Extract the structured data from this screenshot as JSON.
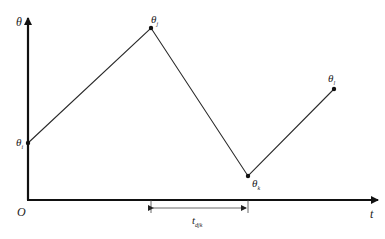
{
  "diagram": {
    "axes": {
      "y_label": "θ",
      "x_label": "t",
      "origin_label": "O"
    },
    "points": [
      {
        "id": "i",
        "base": "θ",
        "sub": "i",
        "x": 28,
        "y": 143
      },
      {
        "id": "j",
        "base": "θ",
        "sub": "j",
        "x": 151,
        "y": 28
      },
      {
        "id": "k",
        "base": "θ",
        "sub": "k",
        "x": 248,
        "y": 176
      },
      {
        "id": "l",
        "base": "θ",
        "sub": "l",
        "x": 334,
        "y": 89
      }
    ],
    "interval": {
      "base": "t",
      "sub": "djk",
      "from_point": "j",
      "to_point": "k"
    },
    "colors": {
      "line": "#2a2a2a",
      "axis": "#111111"
    }
  }
}
